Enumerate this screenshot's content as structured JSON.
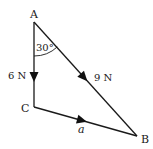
{
  "diagram": {
    "type": "triangle-of-forces",
    "vertices": {
      "A": {
        "label": "A"
      },
      "B": {
        "label": "B"
      },
      "C": {
        "label": "C"
      }
    },
    "edges": [
      {
        "from": "A",
        "to": "C",
        "label": "6 N",
        "direction": "A→C"
      },
      {
        "from": "A",
        "to": "B",
        "label": "9 N",
        "direction": "A→B"
      },
      {
        "from": "C",
        "to": "B",
        "label": "a",
        "direction": "C→B"
      }
    ],
    "angle": {
      "at": "A",
      "between": [
        "AC",
        "AB"
      ],
      "label": "30°"
    },
    "colors": {
      "line": "#1a1a1a",
      "background": "#ffffff"
    }
  },
  "labels": {
    "vertex_a": "A",
    "vertex_b": "B",
    "vertex_c": "C",
    "force_ac": "6 N",
    "force_ab": "9 N",
    "side_cb": "a",
    "angle_a": "30°"
  }
}
